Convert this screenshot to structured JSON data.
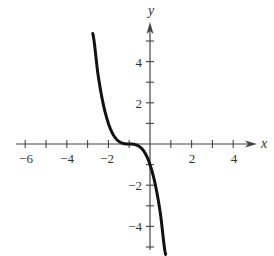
{
  "chart_data": {
    "type": "line",
    "title": "",
    "xlabel": "x",
    "ylabel": "y",
    "xlim": [
      -6.6,
      5.1
    ],
    "ylim": [
      -5.3,
      6
    ],
    "grid": false,
    "legend": null,
    "x_ticks": [
      -6,
      -5,
      -4,
      -3,
      -2,
      -1,
      1,
      2,
      3,
      4
    ],
    "x_tick_labels": [
      "-6",
      "-4",
      "-2",
      "2",
      "4"
    ],
    "x_labeled_ticks": [
      -6,
      -4,
      -2,
      2,
      4
    ],
    "y_ticks": [
      -5,
      -4,
      -3,
      -2,
      -1,
      1,
      2,
      3,
      4,
      5
    ],
    "y_tick_labels": [
      "-4",
      "-2",
      "2",
      "4"
    ],
    "y_labeled_ticks": [
      -4,
      -2,
      2,
      4
    ],
    "series": [
      {
        "name": "f(x)",
        "description": "cubic curve, decreasing, inflection at (-1, 0)",
        "x": [
          -2.75,
          -2.5,
          -2.25,
          -2.0,
          -1.75,
          -1.5,
          -1.25,
          -1.0,
          -0.75,
          -0.5,
          -0.25,
          0.0,
          0.25,
          0.5,
          0.75
        ],
        "y": [
          5.36,
          3.38,
          1.95,
          1.0,
          0.42,
          0.13,
          0.02,
          0.0,
          -0.02,
          -0.13,
          -0.42,
          -1.0,
          -1.95,
          -3.38,
          -5.36
        ],
        "color": "#111111"
      }
    ],
    "annotations": []
  },
  "labels": {
    "x_axis": "x",
    "y_axis": "y",
    "x_ticks": [
      "−6",
      "−4",
      "−2",
      "2",
      "4"
    ],
    "y_ticks": [
      "4",
      "2",
      "−2",
      "−4"
    ]
  }
}
